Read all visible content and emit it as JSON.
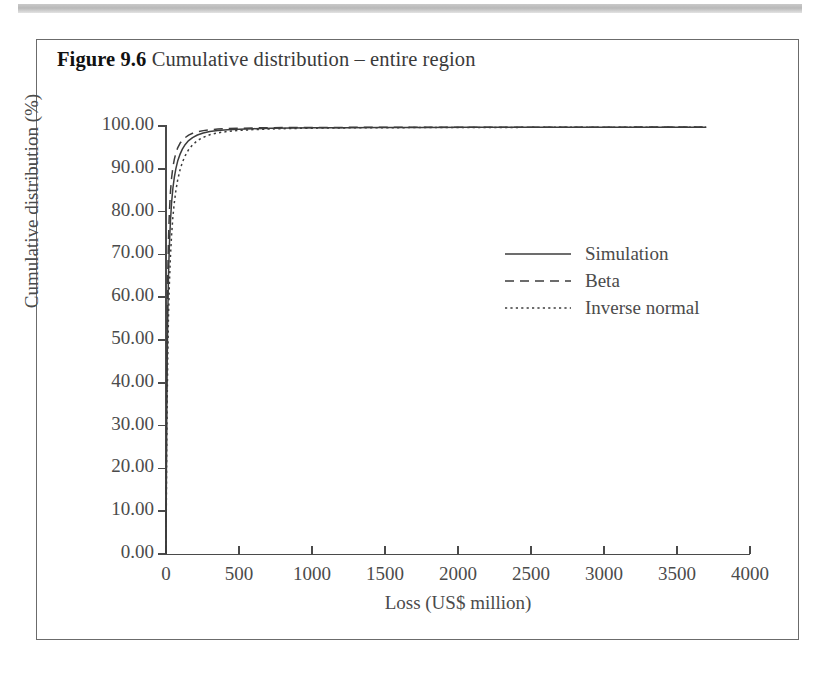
{
  "figure": {
    "number": "Figure 9.6",
    "caption": "Cumulative distribution – entire region"
  },
  "chart_data": {
    "type": "line",
    "title": "Cumulative distribution – entire region",
    "xlabel": "Loss (US$ million)",
    "ylabel": "Cumulative distribution (%)",
    "xlim": [
      0,
      4000
    ],
    "ylim": [
      0,
      100
    ],
    "xticks": [
      0,
      500,
      1000,
      1500,
      2000,
      2500,
      3000,
      3500,
      4000
    ],
    "xticklabels": [
      "0",
      "500",
      "1000",
      "1500",
      "2000",
      "2500",
      "3000",
      "3500",
      "4000"
    ],
    "yticks": [
      0,
      10,
      20,
      30,
      40,
      50,
      60,
      70,
      80,
      90,
      100
    ],
    "yticklabels": [
      "0.00",
      "10.00",
      "20.00",
      "30.00",
      "40.00",
      "50.00",
      "60.00",
      "70.00",
      "80.00",
      "90.00",
      "100.00"
    ],
    "grid": false,
    "legend_position": "center-right",
    "line_color": "#3c3c3c",
    "series": [
      {
        "name": "Simulation",
        "style": "solid",
        "x": [
          0,
          2,
          5,
          8,
          12,
          17,
          23,
          30,
          38,
          47,
          57,
          68,
          80,
          95,
          112,
          132,
          155,
          182,
          215,
          255,
          300,
          355,
          420,
          500,
          600,
          720,
          860,
          1030,
          1230,
          1470,
          1750,
          2080,
          2450,
          2870,
          3320,
          3700
        ],
        "y": [
          0,
          14.5,
          32.0,
          44.0,
          55.5,
          65.0,
          72.0,
          77.5,
          82.0,
          85.4,
          88.0,
          90.1,
          91.8,
          93.3,
          94.6,
          95.7,
          96.6,
          97.3,
          97.9,
          98.35,
          98.7,
          98.95,
          99.12,
          99.26,
          99.38,
          99.46,
          99.52,
          99.57,
          99.61,
          99.64,
          99.66,
          99.68,
          99.69,
          99.7,
          99.71,
          99.72
        ]
      },
      {
        "name": "Beta",
        "style": "dashed",
        "x": [
          0,
          2,
          5,
          8,
          12,
          17,
          23,
          30,
          38,
          47,
          57,
          68,
          80,
          95,
          112,
          132,
          155,
          182,
          215,
          255,
          300,
          355,
          420,
          500,
          600,
          720,
          860,
          1030,
          1230,
          1470,
          1750,
          2080,
          2450,
          2870,
          3320,
          3700
        ],
        "y": [
          0,
          20.0,
          41.0,
          54.0,
          65.0,
          73.5,
          79.8,
          84.4,
          87.8,
          90.3,
          92.2,
          93.7,
          94.9,
          95.9,
          96.7,
          97.3,
          97.85,
          98.3,
          98.65,
          98.92,
          99.12,
          99.27,
          99.39,
          99.48,
          99.55,
          99.6,
          99.64,
          99.66,
          99.68,
          99.7,
          99.71,
          99.72,
          99.73,
          99.73,
          99.74,
          99.74
        ]
      },
      {
        "name": "Inverse normal",
        "style": "dotted",
        "x": [
          0,
          2,
          5,
          8,
          12,
          17,
          23,
          30,
          38,
          47,
          57,
          68,
          80,
          95,
          112,
          132,
          155,
          182,
          215,
          255,
          300,
          355,
          420,
          500,
          600,
          720,
          860,
          1030,
          1230,
          1470,
          1750,
          2080,
          2450,
          2870,
          3320,
          3700
        ],
        "y": [
          0,
          10.5,
          25.0,
          35.5,
          46.0,
          55.5,
          63.0,
          69.2,
          74.4,
          78.7,
          82.1,
          85.0,
          87.4,
          89.6,
          91.5,
          93.1,
          94.5,
          95.6,
          96.6,
          97.35,
          97.95,
          98.4,
          98.72,
          98.97,
          99.16,
          99.31,
          99.42,
          99.5,
          99.56,
          99.6,
          99.63,
          99.66,
          99.68,
          99.69,
          99.7,
          99.71
        ]
      }
    ]
  }
}
